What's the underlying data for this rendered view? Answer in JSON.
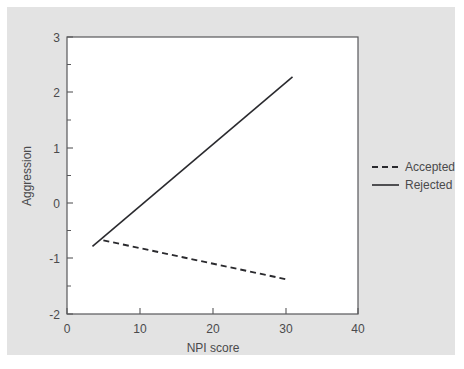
{
  "figure": {
    "background_color": "#e3e3e3",
    "plot_background_color": "#ffffff",
    "frame_color": "#58585a"
  },
  "chart_data": {
    "type": "line",
    "title": "",
    "subtitle": "",
    "xlabel": "NPI score",
    "ylabel": "Aggression",
    "xlim": [
      0,
      40
    ],
    "ylim": [
      -2,
      3
    ],
    "xticks": [
      0,
      10,
      20,
      30,
      40
    ],
    "xtick_labels": [
      "0",
      "10",
      "20",
      "30",
      "40"
    ],
    "yticks": [
      -2,
      -1,
      0,
      1,
      2,
      3
    ],
    "ytick_labels": [
      "-2",
      "-1",
      "0",
      "1",
      "2",
      "3"
    ],
    "yticks_minor": [
      -1.5,
      -0.5,
      0.5,
      1.5,
      2.5
    ],
    "grid": false,
    "legend_position": "right-outside",
    "series": [
      {
        "name": "Accepted",
        "style": "dashed",
        "color": "#2a2a2e",
        "x": [
          5.0,
          30.0
        ],
        "y": [
          -0.67,
          -1.37
        ]
      },
      {
        "name": "Rejected",
        "style": "solid",
        "color": "#2a2a2e",
        "x": [
          3.5,
          31.0
        ],
        "y": [
          -0.78,
          2.28
        ]
      }
    ]
  },
  "legend": {
    "entries": [
      {
        "label": "Accepted",
        "style": "dashed"
      },
      {
        "label": "Rejected",
        "style": "solid"
      }
    ]
  }
}
